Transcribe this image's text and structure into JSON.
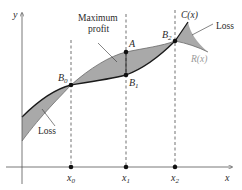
{
  "diagram": {
    "type": "profit-loss-revenue-cost",
    "axes": {
      "x_label": "x",
      "y_label": "y"
    },
    "x_ticks": [
      {
        "base": "x",
        "sub": "0"
      },
      {
        "base": "x",
        "sub": "1"
      },
      {
        "base": "x",
        "sub": "2"
      }
    ],
    "points": [
      {
        "base": "B",
        "sub": "0"
      },
      {
        "base": "A",
        "sub": ""
      },
      {
        "base": "B",
        "sub": "1"
      },
      {
        "base": "B",
        "sub": "2"
      }
    ],
    "curves": {
      "cost": "C(x)",
      "revenue": "R(x)"
    },
    "annotations": {
      "max_profit_line1": "Maximum",
      "max_profit_line2": "profit",
      "loss_left": "Loss",
      "loss_right": "Loss"
    },
    "colors": {
      "fill": "#a9a9a9",
      "curve": "#1a1a1a",
      "axis": "#555555",
      "revenue_label": "#9a9a9a"
    }
  }
}
